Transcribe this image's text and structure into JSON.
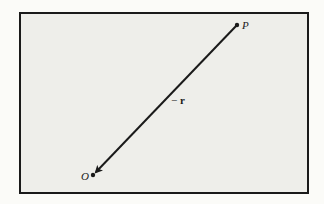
{
  "diagram": {
    "points": {
      "P": {
        "label": "P",
        "x": 237,
        "y": 25
      },
      "O": {
        "label": "O",
        "x": 93,
        "y": 175
      }
    },
    "vector": {
      "from": "P",
      "to": "O",
      "label": "− r",
      "label_prefix": "−",
      "label_symbol": "r"
    },
    "colors": {
      "frame_border": "#1a1a1a",
      "frame_fill": "#eeeeea",
      "ink": "#1a1a1a"
    }
  }
}
